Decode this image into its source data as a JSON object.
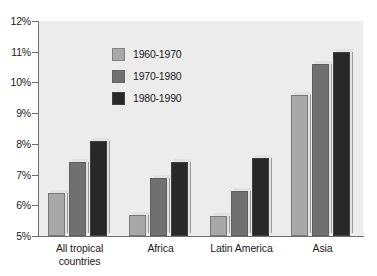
{
  "chart_data": {
    "type": "bar",
    "title": "",
    "subtitle": "",
    "xlabel": "",
    "ylabel": "",
    "ylim": [
      5,
      12
    ],
    "ytick_labels": [
      "12%",
      "11%",
      "10%",
      "9%",
      "8%",
      "7%",
      "6%",
      "5%"
    ],
    "ytick_values": [
      12,
      11,
      10,
      9,
      8,
      7,
      6,
      5
    ],
    "grid": false,
    "legend_position": "inside-top-left",
    "categories": [
      "All tropical countries",
      "Africa",
      "Latin America",
      "Asia"
    ],
    "category_lines": [
      [
        "All tropical",
        "countries"
      ],
      [
        "Africa"
      ],
      [
        "Latin America"
      ],
      [
        "Asia"
      ]
    ],
    "series": [
      {
        "name": "1960-1970",
        "color": "#a8a8a8",
        "values": [
          6.4,
          5.7,
          5.65,
          9.6
        ]
      },
      {
        "name": "1970-1980",
        "color": "#707070",
        "values": [
          7.4,
          6.9,
          6.45,
          10.6
        ]
      },
      {
        "name": "1980-1990",
        "color": "#282828",
        "values": [
          8.1,
          7.4,
          7.55,
          11.0
        ]
      }
    ]
  },
  "legend": {
    "items": [
      {
        "label": "1960-1970"
      },
      {
        "label": "1970-1980"
      },
      {
        "label": "1980-1990"
      }
    ]
  },
  "colors": {
    "plot_background": "#ececec",
    "page_background": "#ffffff",
    "axis": "#6e6e6e",
    "text": "#1a1a1a"
  }
}
